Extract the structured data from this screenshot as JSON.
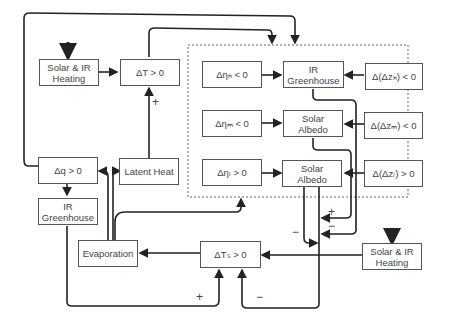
{
  "diagram": {
    "boxes": {
      "solar_ir_heating_top": {
        "line1": "Solar & IR",
        "line2": "Heating"
      },
      "delta_t": {
        "label": "ΔT > 0"
      },
      "delta_q": {
        "label": "Δq > 0"
      },
      "latent_heat": {
        "label": "Latent Heat"
      },
      "ir_greenhouse_left": {
        "line1": "IR",
        "line2": "Greenhouse"
      },
      "evaporation": {
        "label": "Evaporation"
      },
      "delta_ts": {
        "label": "ΔTₛ > 0"
      },
      "solar_ir_heating_bottom": {
        "line1": "Solar & IR",
        "line2": "Heating"
      },
      "eta_h": {
        "label": "Δηₕ < 0"
      },
      "eta_m": {
        "label": "Δηₘ < 0"
      },
      "eta_l": {
        "label": "Δηₗ > 0"
      },
      "ir_greenhouse_cloud": {
        "line1": "IR",
        "line2": "Greenhouse"
      },
      "solar_albedo_m": {
        "line1": "Solar",
        "line2": "Albedo"
      },
      "solar_albedo_l": {
        "line1": "Solar",
        "line2": "Albedo"
      },
      "dz_h": {
        "label": "Δ(Δzₕ) < 0"
      },
      "dz_m": {
        "label": "Δ(Δzₘ) < 0"
      },
      "dz_l": {
        "label": "Δ(Δzₗ) > 0"
      }
    },
    "signs": {
      "latent_to_dt": "+",
      "cloud_plus": "+",
      "cloud_minus": "−",
      "albedo_minus": "−",
      "greenhouse_to_ts": "+",
      "feedback_minus": "−",
      "sfc_minus": "−"
    },
    "colors": {
      "line": "#222222",
      "box_border": "#555555",
      "dashed": "#666666"
    }
  }
}
